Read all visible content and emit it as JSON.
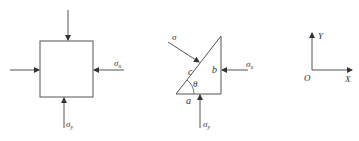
{
  "colors": {
    "line": "#555555",
    "text": "#333333",
    "background": "#ffffff"
  },
  "figure_left": {
    "label_sigma_x": "σx",
    "label_sigma_y": "σy",
    "sub_x": "x",
    "sub_y": "y"
  },
  "figure_middle": {
    "label_sigma": "σ",
    "label_c": "c",
    "label_b": "b",
    "label_a": "a",
    "label_theta": "θ",
    "label_sigma_x": "σ",
    "sub_x": "x",
    "label_sigma_y": "σ",
    "sub_y": "y"
  },
  "figure_right": {
    "label_y": "Y",
    "label_x": "X",
    "label_origin": "O"
  },
  "sigma": "σ"
}
